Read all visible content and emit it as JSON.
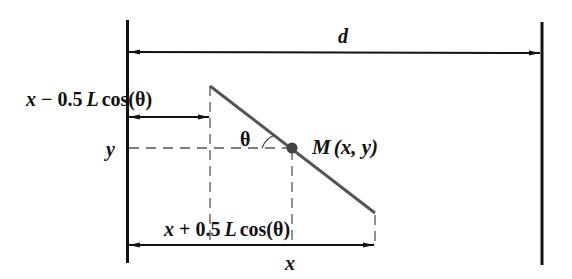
{
  "diagram": {
    "labels": {
      "distance": "d",
      "left_offset": {
        "var": "x",
        "op": " − 0.5",
        "L": "L",
        "cos": "cos(θ)"
      },
      "y_coord": "y",
      "angle": "θ",
      "point": {
        "name": "M",
        "coords": "(x, y)"
      },
      "right_offset": {
        "var": "x",
        "op": " + 0.5",
        "L": "L",
        "cos": "cos(θ)"
      },
      "x_coord": "x"
    },
    "colors": {
      "walls": "#111111",
      "rod": "#555555",
      "point": "#444444",
      "dashes": "#555555"
    }
  }
}
